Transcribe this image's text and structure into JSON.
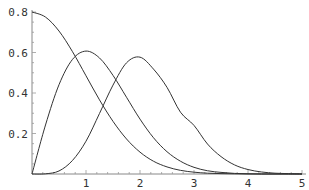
{
  "chart_data": {
    "type": "line",
    "title": "",
    "xlabel": "",
    "ylabel": "",
    "xlim": [
      0,
      5
    ],
    "ylim": [
      0,
      0.8
    ],
    "grid": false,
    "legend": null,
    "x_ticks": [
      "1",
      "2",
      "3",
      "4",
      "5"
    ],
    "y_ticks": [
      "0.2",
      "0.4",
      "0.6",
      "0.8"
    ],
    "x": [
      0,
      0.25,
      0.5,
      0.75,
      1.0,
      1.25,
      1.5,
      1.75,
      2.0,
      2.25,
      2.5,
      2.75,
      3.0,
      3.25,
      3.5,
      3.75,
      4.0,
      4.25,
      4.5,
      4.75,
      5.0
    ],
    "series": [
      {
        "name": "curve-1",
        "values": [
          0.8,
          0.775,
          0.706,
          0.604,
          0.485,
          0.366,
          0.26,
          0.173,
          0.108,
          0.063,
          0.035,
          0.018,
          0.009,
          0.004,
          0.002,
          0.001,
          0.0003,
          0.0001,
          0.0,
          0.0,
          0.0
        ]
      },
      {
        "name": "curve-2",
        "values": [
          0.0,
          0.242,
          0.441,
          0.566,
          0.607,
          0.573,
          0.487,
          0.379,
          0.271,
          0.179,
          0.11,
          0.063,
          0.033,
          0.016,
          0.008,
          0.003,
          0.001,
          0.0,
          0.0,
          0.0,
          0.0
        ]
      },
      {
        "name": "curve-3",
        "values": [
          0.0,
          0.001,
          0.015,
          0.067,
          0.162,
          0.299,
          0.439,
          0.549,
          0.577,
          0.518,
          0.428,
          0.305,
          0.24,
          0.148,
          0.086,
          0.045,
          0.022,
          0.01,
          0.004,
          0.002,
          0.0004
        ]
      }
    ]
  }
}
